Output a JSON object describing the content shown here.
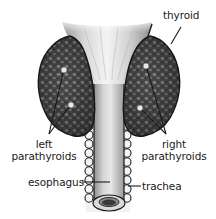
{
  "diagram": {
    "colors": {
      "background": "#ffffff",
      "gland_fill": "#5a5a5a",
      "gland_dark": "#2e2e2e",
      "gland_light": "#8a8a8a",
      "esophagus_fill": "#cfcfcf",
      "trachea_ring": "#f2f2f2",
      "outline": "#1a1a1a",
      "parathyroid_dot": "#e6e6e6",
      "label_text": "#1a1a1a"
    },
    "labels": {
      "thyroid": "thyroid",
      "left_parathyroids_line1": "left",
      "left_parathyroids_line2": "parathyroids",
      "right_parathyroids_line1": "right",
      "right_parathyroids_line2": "parathyroids",
      "esophagus": "esophagus",
      "trachea": "trachea"
    },
    "structures": [
      {
        "name": "thyroid",
        "parts": [
          "left lobe",
          "right lobe"
        ]
      },
      {
        "name": "left parathyroids",
        "count": 2
      },
      {
        "name": "right parathyroids",
        "count": 2
      },
      {
        "name": "esophagus"
      },
      {
        "name": "trachea"
      }
    ]
  }
}
